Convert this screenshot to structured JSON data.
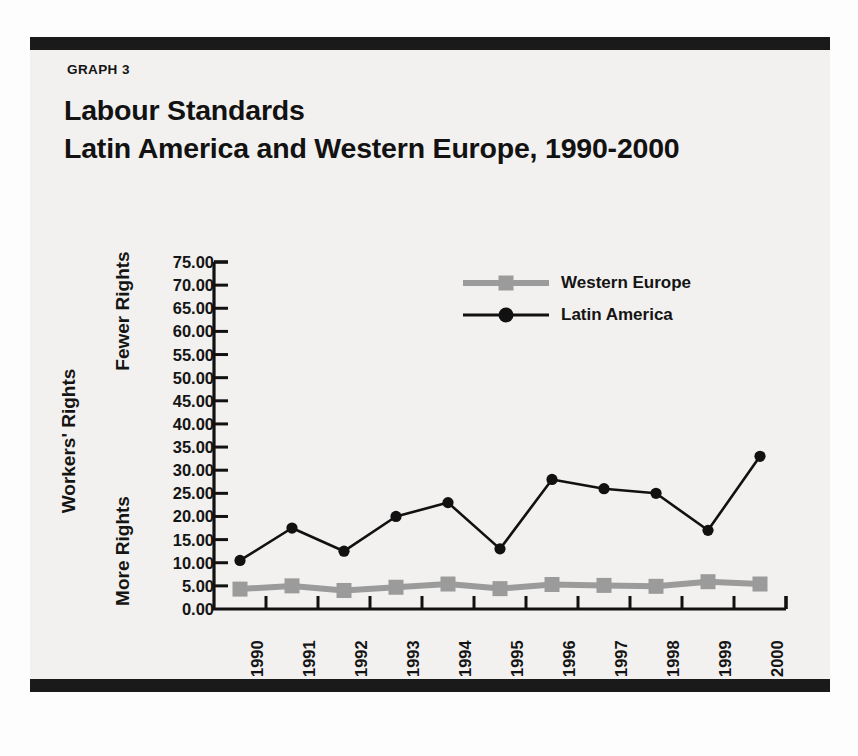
{
  "figure": {
    "graph_label": "GRAPH 3",
    "title_line1": "Labour Standards",
    "title_line2": "Latin America and Western Europe, 1990-2000"
  },
  "axis": {
    "y_axis_title": "Workers' Rights",
    "y_top_annotation": "Fewer Rights",
    "y_bottom_annotation": "More Rights"
  },
  "legend": {
    "items": [
      {
        "label": "Western Europe",
        "color": "#9b9b9b",
        "marker": "square"
      },
      {
        "label": "Latin America",
        "color": "#111111",
        "marker": "circle"
      }
    ]
  },
  "colors": {
    "rule": "#1a1a1a",
    "panel": "#f2f1ef",
    "latin_america": "#111111",
    "western_europe": "#9b9b9b",
    "axis": "#111111"
  },
  "chart_data": {
    "type": "line",
    "subtitle": "GRAPH 3",
    "xlabel": "",
    "ylabel": "Workers' Rights",
    "x": [
      "1990",
      "1991",
      "1992",
      "1993",
      "1994",
      "1995",
      "1996",
      "1997",
      "1998",
      "1999",
      "2000"
    ],
    "categories": [
      "1990",
      "1991",
      "1992",
      "1993",
      "1994",
      "1995",
      "1996",
      "1997",
      "1998",
      "1999",
      "2000"
    ],
    "series": [
      {
        "name": "Latin America",
        "color": "#111111",
        "marker": "circle",
        "values": [
          10.5,
          17.5,
          12.5,
          20.0,
          23.0,
          13.0,
          28.0,
          26.0,
          25.0,
          17.0,
          33.0
        ]
      },
      {
        "name": "Western Europe",
        "color": "#9b9b9b",
        "marker": "square",
        "values": [
          4.3,
          5.0,
          4.0,
          4.7,
          5.4,
          4.4,
          5.3,
          5.1,
          4.9,
          5.9,
          5.4
        ]
      }
    ],
    "ylim": [
      0,
      75
    ],
    "ytick_labels": [
      "75.00",
      "70.00",
      "65.00",
      "60.00",
      "55.00",
      "50.00",
      "45.00",
      "40.00",
      "35.00",
      "30.00",
      "25.00",
      "20.00",
      "15.00",
      "10.00",
      "5.00",
      "0.00"
    ],
    "yticks": [
      75,
      70,
      65,
      60,
      55,
      50,
      45,
      40,
      35,
      30,
      25,
      20,
      15,
      10,
      5,
      0
    ],
    "grid": false,
    "legend_position": "upper-center"
  }
}
